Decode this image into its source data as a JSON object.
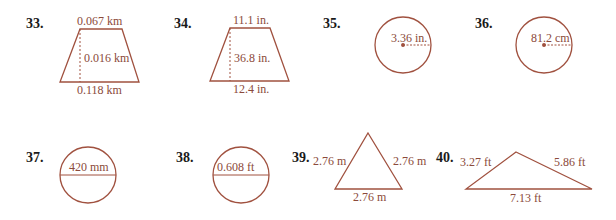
{
  "problems": [
    {
      "number": "33.",
      "shape": "trapezoid",
      "top": "0.067 km",
      "height": "0.016 km",
      "bottom": "0.118 km"
    },
    {
      "number": "34.",
      "shape": "trapezoid",
      "top": "11.1 in.",
      "height": "36.8 in.",
      "bottom": "12.4 in."
    },
    {
      "number": "35.",
      "shape": "circle-radius",
      "radius": "3.36 in."
    },
    {
      "number": "36.",
      "shape": "circle-radius",
      "radius": "81.2 cm"
    },
    {
      "number": "37.",
      "shape": "circle-diameter",
      "diameter": "420 mm"
    },
    {
      "number": "38.",
      "shape": "circle-diameter",
      "diameter": "0.608 ft"
    },
    {
      "number": "39.",
      "shape": "triangle",
      "left": "2.76 m",
      "right": "2.76 m",
      "bottom": "2.76 m"
    },
    {
      "number": "40.",
      "shape": "triangle",
      "left": "3.27 ft",
      "right": "5.86 ft",
      "bottom": "7.13 ft"
    }
  ],
  "colors": {
    "stroke": "#a0513f",
    "label": "#8b4a3a",
    "number": "#1a1a1a"
  }
}
